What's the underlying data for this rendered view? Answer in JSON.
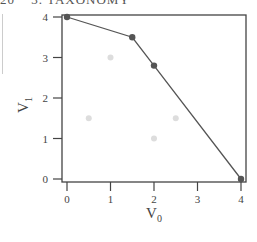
{
  "header": {
    "page_number": "20",
    "chapter": "3. TAXONOMY"
  },
  "chart_data": {
    "type": "scatter",
    "title": "",
    "xlabel": "V0",
    "ylabel": "V1",
    "xlim": [
      0,
      4
    ],
    "ylim": [
      0,
      4
    ],
    "x_ticks": [
      "0",
      "1",
      "2",
      "3",
      "4"
    ],
    "y_ticks": [
      "0",
      "1",
      "2",
      "3",
      "4"
    ],
    "grid": false,
    "legend": null,
    "series": [
      {
        "name": "pareto_front",
        "style": "line+markers",
        "color": "#555555",
        "points": [
          [
            0,
            4
          ],
          [
            1.5,
            3.5
          ],
          [
            2,
            2.8
          ],
          [
            4,
            0
          ]
        ]
      },
      {
        "name": "dominated",
        "style": "markers",
        "color": "#dddddd",
        "points": [
          [
            1,
            3
          ],
          [
            0.5,
            1.5
          ],
          [
            2,
            1
          ],
          [
            2.5,
            1.5
          ]
        ]
      }
    ]
  }
}
